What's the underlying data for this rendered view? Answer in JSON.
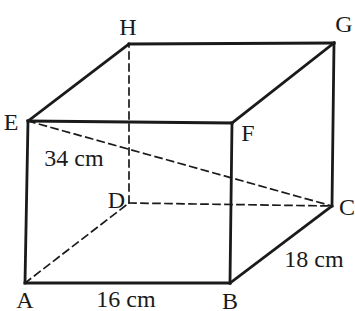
{
  "figure": {
    "type": "cuboid-wireframe",
    "background_color": "#ffffff",
    "line_color": "#1a1a1a",
    "text_color": "#1a1a1a",
    "solid_stroke_width": 2.8,
    "dashed_stroke_width": 1.7,
    "dash_pattern": "7 5",
    "vertices": {
      "A": {
        "x": 25,
        "y": 283
      },
      "B": {
        "x": 230,
        "y": 283
      },
      "C": {
        "x": 332,
        "y": 206
      },
      "D": {
        "x": 129,
        "y": 203
      },
      "E": {
        "x": 28,
        "y": 121
      },
      "F": {
        "x": 232,
        "y": 123
      },
      "G": {
        "x": 334,
        "y": 43
      },
      "H": {
        "x": 129,
        "y": 44
      }
    },
    "solid_edges": [
      [
        "A",
        "B"
      ],
      [
        "B",
        "F"
      ],
      [
        "F",
        "E"
      ],
      [
        "E",
        "A"
      ],
      [
        "E",
        "H"
      ],
      [
        "H",
        "G"
      ],
      [
        "G",
        "F"
      ],
      [
        "G",
        "C"
      ],
      [
        "B",
        "C"
      ]
    ],
    "dashed_edges": [
      [
        "A",
        "D"
      ],
      [
        "D",
        "C"
      ],
      [
        "D",
        "H"
      ]
    ],
    "dashed_diagonals": [
      [
        "E",
        "C"
      ]
    ],
    "vertex_labels": [
      {
        "text": "A",
        "x": 25,
        "y": 308,
        "anchor": "middle"
      },
      {
        "text": "B",
        "x": 230,
        "y": 309,
        "anchor": "middle"
      },
      {
        "text": "C",
        "x": 347,
        "y": 215,
        "anchor": "middle"
      },
      {
        "text": "D",
        "x": 125,
        "y": 208,
        "anchor": "end"
      },
      {
        "text": "E",
        "x": 11,
        "y": 130,
        "anchor": "middle"
      },
      {
        "text": "F",
        "x": 248,
        "y": 141,
        "anchor": "middle"
      },
      {
        "text": "G",
        "x": 344,
        "y": 32,
        "anchor": "middle"
      },
      {
        "text": "H",
        "x": 128,
        "y": 35,
        "anchor": "middle"
      }
    ],
    "measurement_labels": [
      {
        "text": "34 cm",
        "edge": "EC",
        "x": 74,
        "y": 166,
        "anchor": "middle"
      },
      {
        "text": "16 cm",
        "edge": "AB",
        "x": 126,
        "y": 307,
        "anchor": "middle"
      },
      {
        "text": "18 cm",
        "edge": "BC",
        "x": 314,
        "y": 267,
        "anchor": "middle"
      }
    ]
  }
}
